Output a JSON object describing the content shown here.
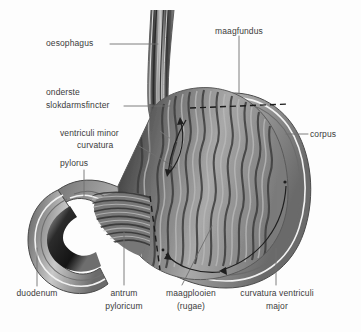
{
  "figure": {
    "language": "nl",
    "background_color": "#fdfdfd",
    "ink_color": "#3b3b3b"
  },
  "labels": {
    "oesophagus": "oesophagus",
    "onderste": "onderste",
    "slokdarmsfincter": "slokdarmsfincter",
    "ventriculi_minor": "ventriculi minor",
    "curvatura": "curvatura",
    "pylorus": "pylorus",
    "duodenum": "duodenum",
    "antrum": "antrum",
    "pyloricum": "pyloricum",
    "maagplooien": "maagplooien",
    "rugae": "(rugae)",
    "curvatura_ventriculi": "curvatura ventriculi",
    "major": "major",
    "maagfundus": "maagfundus",
    "corpus": "corpus"
  }
}
